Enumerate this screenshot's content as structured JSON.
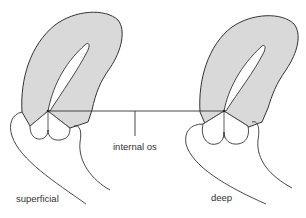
{
  "diagram": {
    "type": "anatomical-illustration",
    "labels": {
      "internal_os": "internal os",
      "superficial": "superficial",
      "deep": "deep"
    },
    "figures": [
      {
        "name": "superficial",
        "position": "left"
      },
      {
        "name": "deep",
        "position": "right"
      }
    ],
    "colors": {
      "fill": "#d9d9d9",
      "stroke": "#333333",
      "background": "#ffffff"
    }
  }
}
